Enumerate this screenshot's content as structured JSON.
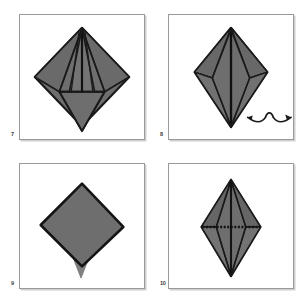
{
  "document": {
    "title": "Origami Folding Instructions — Steps 7 to 10",
    "kind": "instructional-diagram",
    "page_background": "#ffffff"
  },
  "palette": {
    "paper_fill": "#6e6e6e",
    "paper_fill_light": "#7c7c7c",
    "paper_fill_dark": "#5e5e5e",
    "outline": "#1a1a1a",
    "crease_line": "#2b2b2b",
    "panel_border": "#9a9a9a",
    "panel_shadow": "#cfcfcf",
    "panel_background": "#ffffff",
    "label_color": "#3a3a3a"
  },
  "panels": [
    {
      "step_number": "7",
      "name": "panel-step-7",
      "description": "Diamond (square on point) with narrow vertical petal creases converging at the top vertex and a lower triangular flap outlined across the lower half.",
      "figure": "diamond-with-petal-creases"
    },
    {
      "step_number": "8",
      "name": "panel-step-8",
      "description": "Kite shape with wide upper shoulders, a long vertical centre crease running the full height and two angled side creases; a turn-over loop arrow sits to the lower right.",
      "figure": "kite-with-centre-crease",
      "symbol": {
        "name": "turn-over-arrow",
        "label": "turn over"
      }
    },
    {
      "step_number": "9",
      "name": "panel-step-9",
      "description": "Plain square rotated on point (diamond) with a lighter narrow triangular point projecting below its bottom vertex.",
      "figure": "diamond-with-lower-point"
    },
    {
      "step_number": "10",
      "name": "panel-step-10",
      "description": "Tall narrow diamond / elongated kite with vertical centre crease, angled side creases, and a horizontal dotted valley-fold crease across the widest part.",
      "figure": "elongated-diamond-with-dotted-crease",
      "crease": {
        "name": "dotted-fold-line",
        "style": "dotted"
      }
    }
  ]
}
